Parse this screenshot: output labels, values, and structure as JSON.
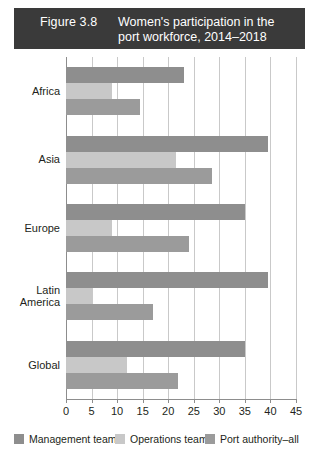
{
  "title": {
    "figure_number": "Figure 3.8",
    "text": "Women's participation in the port workforce, 2014–2018"
  },
  "chart_data": {
    "type": "bar",
    "orientation": "horizontal",
    "title": "Women's participation in the port workforce, 2014–2018",
    "xlabel": "",
    "ylabel": "",
    "xlim": [
      0,
      45
    ],
    "xticks": [
      0,
      5,
      10,
      15,
      20,
      25,
      30,
      35,
      40,
      45
    ],
    "xtick_labels": [
      "0",
      "5",
      "10",
      "15",
      "20",
      "25",
      "30",
      "35",
      "40",
      "45"
    ],
    "grid": true,
    "legend_position": "bottom",
    "categories": [
      "Africa",
      "Asia",
      "Europe",
      "Latin America",
      "Global"
    ],
    "series": [
      {
        "name": "Management team",
        "color": "#8e8e8e",
        "values": [
          23,
          39.5,
          35,
          39.5,
          35
        ]
      },
      {
        "name": "Operations team",
        "color": "#c8c8c8",
        "values": [
          9,
          21.5,
          9,
          5,
          12
        ]
      },
      {
        "name": "Port authority–all",
        "color": "#9b9b9b",
        "values": [
          14.5,
          28.5,
          24,
          17,
          22
        ]
      }
    ]
  },
  "legend": {
    "items": [
      {
        "label": "Management team",
        "color": "#8e8e8e"
      },
      {
        "label": "Operations team",
        "color": "#c8c8c8"
      },
      {
        "label": "Port authority–all",
        "color": "#9b9b9b"
      }
    ]
  },
  "colors": {
    "title_bar_background": "#3a3a3a",
    "title_bar_text": "#ffffff",
    "gridline": "#c9c9c9",
    "axis": "#8d8d8d",
    "text": "#231f20",
    "page_background": "#ffffff"
  }
}
